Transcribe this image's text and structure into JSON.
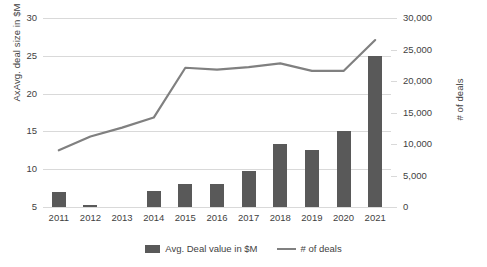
{
  "chart_data": {
    "type": "bar",
    "title": "",
    "subtitle": "",
    "xlabel": "",
    "ylabel": "AxAvg. deal size in $M",
    "y2label": "# of deals",
    "grid": true,
    "legend_position": "bottom",
    "categories": [
      "2011",
      "2012",
      "2013",
      "2014",
      "2015",
      "2016",
      "2017",
      "2018",
      "2019",
      "2020",
      "2021"
    ],
    "ylim": [
      5,
      30
    ],
    "yticks": [
      5,
      10,
      15,
      20,
      25,
      30
    ],
    "ytick_labels": [
      "5",
      "10",
      "15",
      "20",
      "25",
      "30"
    ],
    "y2lim": [
      0,
      30000
    ],
    "y2ticks": [
      0,
      5000,
      10000,
      15000,
      20000,
      25000,
      30000
    ],
    "y2tick_labels": [
      "0",
      "5,000",
      "10,000",
      "15,000",
      "20,000",
      "25,000",
      "30,000"
    ],
    "series": [
      {
        "name": "Avg. Deal value in $M",
        "kind": "bar",
        "axis": "left",
        "color": "#595959",
        "values": [
          7.0,
          5.3,
          null,
          7.1,
          8.0,
          8.0,
          9.8,
          13.4,
          12.6,
          15.0,
          25.0
        ]
      },
      {
        "name": "# of deals",
        "kind": "line",
        "axis": "right",
        "color": "#808080",
        "values": [
          9000,
          11200,
          12600,
          14200,
          22100,
          21800,
          22200,
          22800,
          21600,
          21600,
          26500
        ]
      }
    ]
  },
  "legend": {
    "items": [
      {
        "label": "Avg. Deal value in $M",
        "marker": "bar-swatch",
        "color": "#595959"
      },
      {
        "label": "# of deals",
        "marker": "line-swatch",
        "color": "#808080"
      }
    ]
  },
  "colors": {
    "bar": "#595959",
    "line": "#808080",
    "grid": "#d9d9d9",
    "text": "#3f3f3f",
    "background": "#ffffff"
  }
}
